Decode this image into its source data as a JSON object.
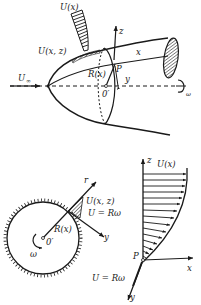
{
  "figure": {
    "top_panel": {
      "description": "3D rotating body of revolution in axial flow with boundary layer profiles",
      "labels": {
        "U_x": "U(x)",
        "U_xz": "U(x, z)",
        "U_inf": "U",
        "U_inf_sub": "∞",
        "z_axis": "z",
        "x_axis": "x",
        "y_axis": "y",
        "P": "P",
        "R_x": "R(x)",
        "O_prime": "0′",
        "omega": "ω"
      }
    },
    "bottom_left_panel": {
      "description": "Cross-section of rotating body with local coordinate frame",
      "labels": {
        "r_axis": "r",
        "U_xz": "U(x, z)",
        "U_eq": "U = Rω",
        "y_axis": "y",
        "R_x": "R(x)",
        "O_prime": "0′",
        "omega": "ω"
      }
    },
    "bottom_right_panel": {
      "description": "Velocity profile U(x) along z with skewed wall component",
      "labels": {
        "z_axis": "z",
        "U_x": "U(x)",
        "P": "P",
        "x_axis": "x",
        "U_eq": "U = Rω",
        "y_axis": "y"
      },
      "profile_arrow_count": 15
    },
    "colors": {
      "ink": "#1a1a1a",
      "background": "#ffffff"
    }
  }
}
